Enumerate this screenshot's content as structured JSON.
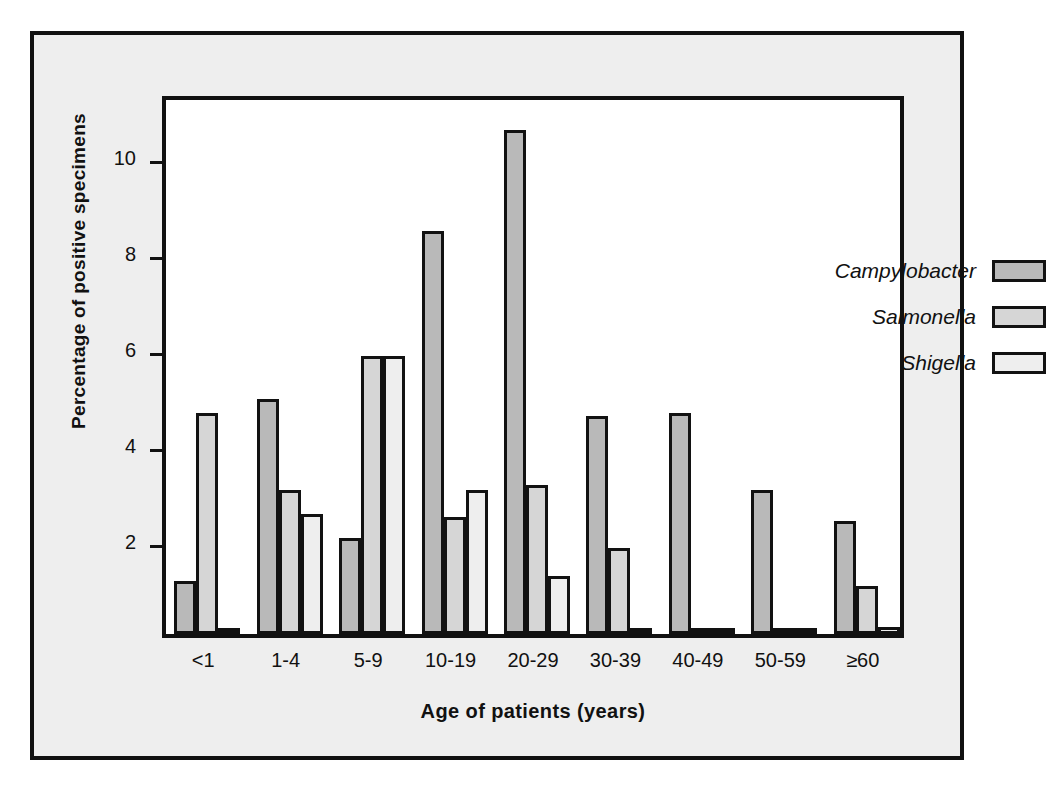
{
  "chart_data": {
    "type": "bar",
    "title": "",
    "xlabel": "Age of patients (years)",
    "ylabel": "Percentage of positive specimens",
    "categories": [
      "<1",
      "1-4",
      "5-9",
      "10-19",
      "20-29",
      "30-39",
      "40-49",
      "50-59",
      "≥60"
    ],
    "series": [
      {
        "name": "Campylobacter",
        "color": "#b9b9b9",
        "values": [
          1.1,
          4.9,
          2.0,
          8.4,
          10.5,
          4.55,
          4.6,
          3.0,
          2.35
        ]
      },
      {
        "name": "Salmonella",
        "color": "#d6d6d6",
        "values": [
          4.6,
          3.0,
          5.8,
          2.45,
          3.1,
          1.8,
          0.1,
          0.1,
          1.0
        ]
      },
      {
        "name": "Shigella",
        "color": "#eeeeee",
        "values": [
          0.12,
          2.5,
          5.8,
          3.0,
          1.2,
          0.12,
          0.12,
          0.08,
          0.15
        ]
      }
    ],
    "ylim": [
      0,
      11.3
    ],
    "yticks": [
      2,
      4,
      6,
      8,
      10
    ],
    "ytick_labels": [
      "2",
      "4",
      "6",
      "8",
      "10"
    ],
    "grid": false,
    "legend_position": "upper-right"
  },
  "legend": {
    "entries": [
      {
        "label": "Campylobacter",
        "swatch_color": "#b9b9b9"
      },
      {
        "label": "Salmonella",
        "swatch_color": "#d6d6d6"
      },
      {
        "label": "Shigella",
        "swatch_color": "#eeeeee"
      }
    ]
  },
  "colors": {
    "page_background": "#ffffff",
    "figure_background": "#eeeeee",
    "plot_background": "#ffffff",
    "axis_line": "#111111",
    "bar_outline": "#121212"
  }
}
